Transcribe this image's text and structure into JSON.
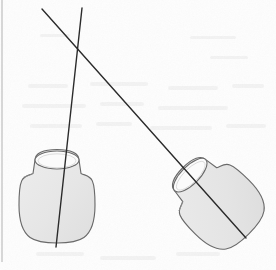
{
  "figure": {
    "title": "Two flask outlines crossed by two straight lines",
    "background_color": "#fdfdfd",
    "paper_tint": "#f7f7f5",
    "stroke_color": "#4a4a4a",
    "line_color": "#2b2b2b",
    "shape_fill": "#e6e6e6",
    "shape_fill_highlight": "#efefef",
    "opening_fill": "#fbfbfb",
    "margin_rule_color": "#b8b8b8"
  },
  "chart_data": {
    "type": "scatter",
    "title": "Two flask outlines crossed by two straight lines",
    "xlabel": "",
    "ylabel": "",
    "xlim": [
      0,
      276
    ],
    "ylim": [
      270,
      0
    ],
    "grid": false,
    "legend": null,
    "annotations": [],
    "shapes": [
      {
        "name": "flask-left",
        "label": "left flask",
        "body_center": [
          57,
          205
        ],
        "body_radius": 38,
        "neck_tip": [
          57,
          158
        ],
        "neck_half_width": 22,
        "neck_rotation_deg": 0,
        "opening_rx": 22,
        "opening_ry": 9,
        "opening_center": [
          57,
          160
        ]
      },
      {
        "name": "flask-right",
        "label": "right flask",
        "body_center": [
          222,
          207
        ],
        "body_radius": 38,
        "neck_tip": [
          188,
          172
        ],
        "neck_half_width": 22,
        "neck_rotation_deg": -45,
        "opening_rx": 22,
        "opening_ry": 9,
        "opening_center": [
          190,
          174
        ]
      }
    ],
    "lines": [
      {
        "name": "line-diagonal",
        "label": "long diagonal line",
        "x": [
          42,
          246
        ],
        "y": [
          9,
          238
        ],
        "width": 1.4
      },
      {
        "name": "line-near-vertical",
        "label": "near-vertical line",
        "x": [
          82,
          56
        ],
        "y": [
          8,
          247
        ],
        "width": 1.4
      }
    ],
    "intersections": [
      {
        "name": "lines-crossing",
        "x": 78,
        "y": 48
      }
    ],
    "margin_rule": {
      "name": "left-margin-rule",
      "x": [
        2,
        2
      ],
      "y": [
        0,
        262
      ]
    }
  }
}
